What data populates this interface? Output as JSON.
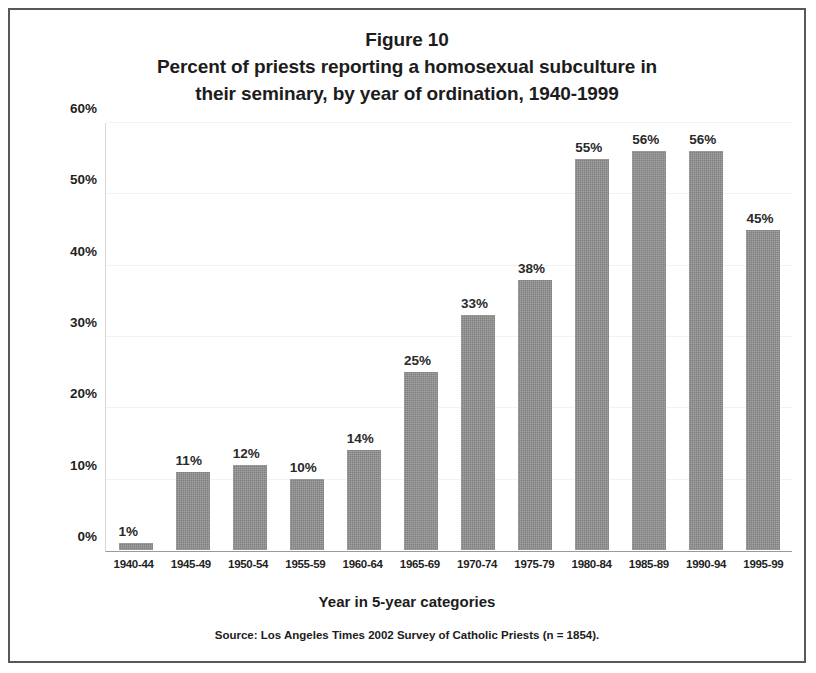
{
  "figure": {
    "title_lines": [
      "Figure 10",
      "Percent of priests reporting a homosexual subculture in",
      "their seminary, by year of ordination, 1940-1999"
    ],
    "source_note": "Source: Los Angeles Times 2002 Survey of Catholic Priests (n = 1854)."
  },
  "colors": {
    "bar_fill": "#8d8d8d",
    "frame_border": "#585858",
    "gridline": "#f2f2f2",
    "axis_line": "#9a9a9a",
    "text": "#1c1c1c"
  },
  "chart_data": {
    "type": "bar",
    "title": "Percent of priests reporting a homosexual subculture in their seminary, by year of ordination, 1940-1999",
    "subtitle": "Figure 10",
    "xlabel": "Year in 5-year categories",
    "ylabel": "",
    "categories": [
      "1940-44",
      "1945-49",
      "1950-54",
      "1955-59",
      "1960-64",
      "1965-69",
      "1970-74",
      "1975-79",
      "1980-84",
      "1985-89",
      "1990-94",
      "1995-99"
    ],
    "values": [
      1,
      11,
      12,
      10,
      14,
      25,
      33,
      38,
      55,
      56,
      56,
      45
    ],
    "value_labels": [
      "1%",
      "11%",
      "12%",
      "10%",
      "14%",
      "25%",
      "33%",
      "38%",
      "55%",
      "56%",
      "56%",
      "45%"
    ],
    "ylim": [
      0,
      60
    ],
    "yticks": [
      0,
      10,
      20,
      30,
      40,
      50,
      60
    ],
    "ytick_labels": [
      "0%",
      "10%",
      "20%",
      "30%",
      "40%",
      "50%",
      "60%"
    ],
    "grid": true,
    "legend": "none",
    "annotations": [
      "Source: Los Angeles Times 2002 Survey of Catholic Priests (n = 1854)."
    ]
  }
}
